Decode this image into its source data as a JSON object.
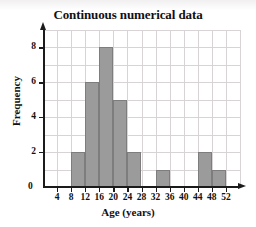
{
  "chart_data": {
    "type": "bar",
    "title": "Continuous numerical data",
    "xlabel": "Age (years)",
    "ylabel": "Frequency",
    "xlim": [
      0,
      56
    ],
    "ylim": [
      0,
      9
    ],
    "grid": true,
    "legend": "none",
    "bin_width": 4,
    "x_tick_labels": [
      "4",
      "8",
      "12",
      "16",
      "20",
      "24",
      "28",
      "32",
      "36",
      "40",
      "44",
      "48",
      "52"
    ],
    "x_tick_values": [
      4,
      8,
      12,
      16,
      20,
      24,
      28,
      32,
      36,
      40,
      44,
      48,
      52
    ],
    "y_tick_labels": [
      "0",
      "2",
      "4",
      "6",
      "8"
    ],
    "y_tick_values": [
      0,
      2,
      4,
      6,
      8
    ],
    "origin_label": "0",
    "bars": [
      {
        "bin_start": 8,
        "bin_end": 12,
        "label": "8-12",
        "value": 2
      },
      {
        "bin_start": 12,
        "bin_end": 16,
        "label": "12-16",
        "value": 6
      },
      {
        "bin_start": 16,
        "bin_end": 20,
        "label": "16-20",
        "value": 8
      },
      {
        "bin_start": 20,
        "bin_end": 24,
        "label": "20-24",
        "value": 5
      },
      {
        "bin_start": 24,
        "bin_end": 28,
        "label": "24-28",
        "value": 2
      },
      {
        "bin_start": 32,
        "bin_end": 36,
        "label": "32-36",
        "value": 1
      },
      {
        "bin_start": 44,
        "bin_end": 48,
        "label": "44-48",
        "value": 2
      },
      {
        "bin_start": 48,
        "bin_end": 52,
        "label": "48-52",
        "value": 1
      }
    ],
    "colors": {
      "bar_fill": "#9b9b9b",
      "bar_border": "#7d7d7d",
      "grid": "#d8d4d5",
      "axis": "#1b1b1b",
      "text": "#111111",
      "background": "#ffffff"
    }
  }
}
